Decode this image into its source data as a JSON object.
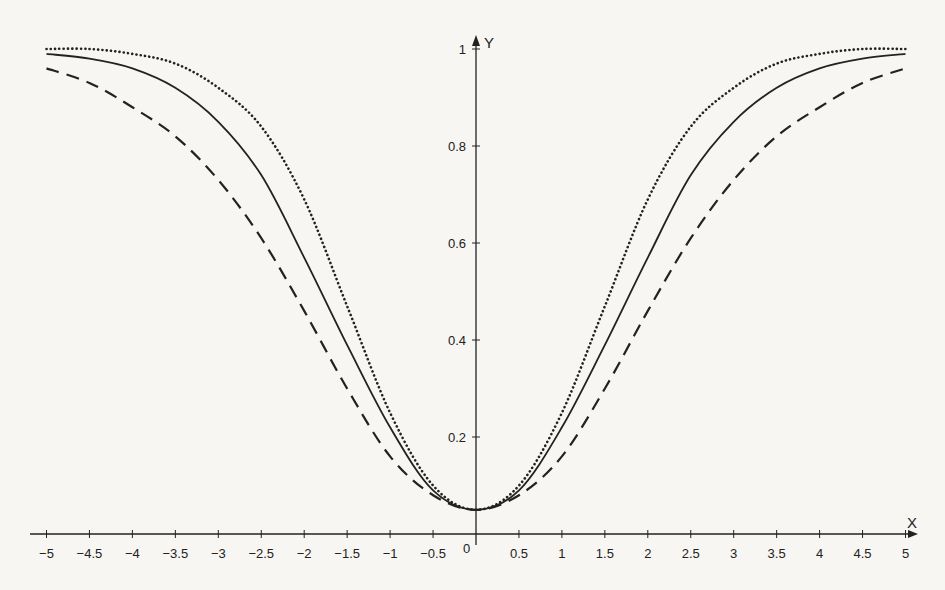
{
  "chart_data": {
    "type": "line",
    "title": "",
    "xlabel": "X",
    "ylabel": "Y",
    "xlim": [
      -5,
      5
    ],
    "ylim": [
      0,
      1
    ],
    "grid": false,
    "legend": null,
    "origin_label": "0",
    "x_ticks": [
      -5,
      -4.5,
      -4,
      -3.5,
      -3,
      -2.5,
      -2,
      -1.5,
      -1,
      -0.5,
      0.5,
      1,
      1.5,
      2,
      2.5,
      3,
      3.5,
      4,
      4.5,
      5
    ],
    "x_tick_labels": [
      "−5",
      "−4.5",
      "−4",
      "−3.5",
      "−3",
      "−2.5",
      "−2",
      "−1.5",
      "−1",
      "−0.5",
      "0.5",
      "1",
      "1.5",
      "2",
      "2.5",
      "3",
      "3.5",
      "4",
      "4.5",
      "5"
    ],
    "y_ticks": [
      0.2,
      0.4,
      0.6,
      0.8,
      1
    ],
    "y_tick_labels": [
      "0.2",
      "0.4",
      "0.6",
      "0.8",
      "1"
    ],
    "x": [
      -5,
      -4.5,
      -4,
      -3.5,
      -3,
      -2.5,
      -2,
      -1.5,
      -1,
      -0.5,
      0,
      0.5,
      1,
      1.5,
      2,
      2.5,
      3,
      3.5,
      4,
      4.5,
      5
    ],
    "series": [
      {
        "name": "dotted curve",
        "style": "dotted",
        "values": [
          1.0,
          1.0,
          0.99,
          0.97,
          0.92,
          0.84,
          0.69,
          0.47,
          0.25,
          0.1,
          0.05,
          0.1,
          0.25,
          0.47,
          0.69,
          0.84,
          0.92,
          0.97,
          0.99,
          1.0,
          1.0
        ]
      },
      {
        "name": "solid curve",
        "style": "solid",
        "values": [
          0.99,
          0.98,
          0.96,
          0.92,
          0.85,
          0.74,
          0.57,
          0.39,
          0.22,
          0.09,
          0.05,
          0.09,
          0.22,
          0.39,
          0.57,
          0.74,
          0.85,
          0.92,
          0.96,
          0.98,
          0.99
        ]
      },
      {
        "name": "dashed curve",
        "style": "dashed",
        "values": [
          0.96,
          0.93,
          0.88,
          0.82,
          0.73,
          0.61,
          0.46,
          0.3,
          0.16,
          0.08,
          0.05,
          0.08,
          0.16,
          0.3,
          0.46,
          0.61,
          0.73,
          0.82,
          0.88,
          0.93,
          0.96
        ]
      }
    ]
  },
  "colors": {
    "ink": "#222222",
    "paper": "#f7f6f3"
  }
}
